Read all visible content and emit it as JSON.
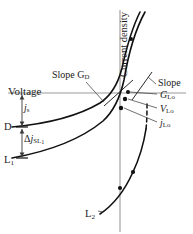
{
  "figure": {
    "kind": "current-density-vs-voltage-diagram",
    "axes": {
      "vertical_axis_label": "Current density",
      "horizontal_axis_label": "Voltage"
    },
    "labels": {
      "slope_dark": "Slope G",
      "slope_dark_sub": "D",
      "slope_light": "Slope",
      "slope_light_symbol": "G",
      "slope_light_sub": "Lo",
      "v_lo_symbol": "V",
      "v_lo_sub": "Lo",
      "j_lo_symbol": "j",
      "j_lo_sub": "Lo",
      "j_s_symbol": "j",
      "j_s_sub": "s",
      "point_d": "D",
      "delta_symbol": "Δ",
      "delta_j_symbol": "j",
      "delta_j_sub": "SL",
      "delta_j_sub2": "1",
      "curve_l1": "L",
      "curve_l1_sub": "1",
      "curve_l2": "L",
      "curve_l2_sub": "2"
    },
    "colors": {
      "curve": "#111111",
      "axis": "#8c8c8c",
      "leader": "#5a5a5a",
      "text": "#1a1a1a",
      "background": "#ffffff"
    },
    "geometry": {
      "vertical_axis_x": 120,
      "voltage_line_y": 93,
      "vertical_axis_top": 10,
      "vertical_axis_bottom": 232,
      "point_d_y": 127,
      "point_l1_y": 158
    }
  }
}
